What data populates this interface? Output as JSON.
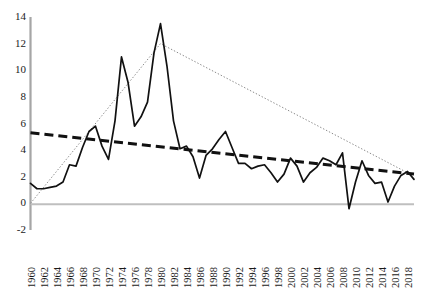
{
  "chart_data": {
    "type": "line",
    "title": "",
    "xlabel": "",
    "ylabel": "",
    "xlim": [
      1960,
      2019
    ],
    "ylim": [
      -2,
      14
    ],
    "ytick_step": 2,
    "xtick_step": 2,
    "grid": false,
    "legend": "none",
    "yticks": [
      14,
      12,
      10,
      8,
      6,
      4,
      2,
      0,
      -2
    ],
    "xticks": [
      1960,
      1962,
      1964,
      1966,
      1968,
      1970,
      1972,
      1974,
      1976,
      1978,
      1980,
      1982,
      1984,
      1986,
      1988,
      1990,
      1992,
      1994,
      1996,
      1998,
      2000,
      2002,
      2004,
      2006,
      2008,
      2010,
      2012,
      2014,
      2016,
      2018
    ],
    "x": [
      1960,
      1961,
      1962,
      1963,
      1964,
      1965,
      1966,
      1967,
      1968,
      1969,
      1970,
      1971,
      1972,
      1973,
      1974,
      1975,
      1976,
      1977,
      1978,
      1979,
      1980,
      1981,
      1982,
      1983,
      1984,
      1985,
      1986,
      1987,
      1988,
      1989,
      1990,
      1991,
      1992,
      1993,
      1994,
      1995,
      1996,
      1997,
      1998,
      1999,
      2000,
      2001,
      2002,
      2003,
      2004,
      2005,
      2006,
      2007,
      2008,
      2009,
      2010,
      2011,
      2012,
      2013,
      2014,
      2015,
      2016,
      2017,
      2018,
      2019
    ],
    "series": [
      {
        "name": "Annual rate",
        "style": "solid",
        "color": "#000000",
        "values": [
          1.5,
          1.1,
          1.1,
          1.2,
          1.3,
          1.6,
          2.9,
          2.8,
          4.2,
          5.4,
          5.8,
          4.3,
          3.3,
          6.2,
          11.0,
          9.1,
          5.8,
          6.5,
          7.6,
          11.3,
          13.5,
          10.3,
          6.2,
          4.1,
          4.3,
          3.5,
          1.9,
          3.6,
          4.1,
          4.8,
          5.4,
          4.2,
          3.0,
          3.0,
          2.6,
          2.8,
          2.9,
          2.3,
          1.6,
          2.2,
          3.4,
          2.8,
          1.6,
          2.3,
          2.7,
          3.4,
          3.2,
          2.9,
          3.8,
          -0.4,
          1.6,
          3.2,
          2.1,
          1.5,
          1.6,
          0.1,
          1.3,
          2.1,
          2.4,
          1.8
        ]
      },
      {
        "name": "Linear trend",
        "style": "dashed",
        "color": "#000000",
        "endpoints": [
          [
            1960,
            5.3
          ],
          [
            2019,
            2.2
          ]
        ]
      },
      {
        "name": "Piecewise trend",
        "style": "dotted",
        "color": "#808080",
        "vertices": [
          [
            1960,
            0.0
          ],
          [
            1980,
            12.0
          ],
          [
            2018,
            2.3
          ]
        ]
      }
    ],
    "axis_color": "#a6a6a6",
    "zero_line": 0
  }
}
